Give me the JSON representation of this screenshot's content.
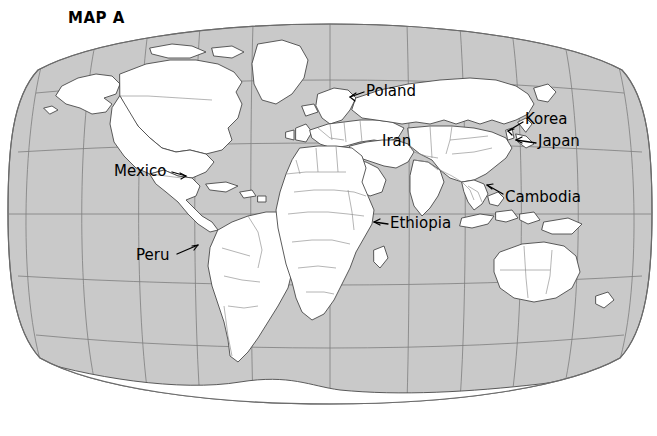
{
  "figure": {
    "title": "MAP A",
    "projection": "robinson",
    "type": "world-political-map",
    "ocean_color": "#c9c9c9",
    "land_color": "#ffffff",
    "coastline_color": "#4a4a4a",
    "border_color": "#8c8c8c",
    "graticule_color": "#7d7d7d",
    "label_color": "#000000",
    "background_color": "#ffffff"
  },
  "graticule": {
    "parallels": [
      60,
      30,
      0,
      -30,
      -60
    ],
    "meridians": [
      -150,
      -120,
      -90,
      -60,
      -30,
      0,
      30,
      60,
      90,
      120,
      150
    ],
    "visible": true
  },
  "labels": [
    {
      "id": "poland",
      "name": "Poland",
      "x": 366,
      "y": 84,
      "leader": true
    },
    {
      "id": "iran",
      "name": "Iran",
      "x": 382,
      "y": 134,
      "leader": false
    },
    {
      "id": "korea",
      "name": "Korea",
      "x": 525,
      "y": 112,
      "leader": true
    },
    {
      "id": "japan",
      "name": "Japan",
      "x": 538,
      "y": 134,
      "leader": true
    },
    {
      "id": "cambodia",
      "name": "Cambodia",
      "x": 505,
      "y": 190,
      "leader": true
    },
    {
      "id": "ethiopia",
      "name": "Ethiopia",
      "x": 390,
      "y": 216,
      "leader": true
    },
    {
      "id": "mexico",
      "name": "Mexico",
      "x": 114,
      "y": 164,
      "leader": true
    },
    {
      "id": "peru",
      "name": "Peru",
      "x": 136,
      "y": 248,
      "leader": true
    }
  ],
  "leader_lines": [
    {
      "id": "poland-leader",
      "from": [
        364,
        92
      ],
      "to": [
        350,
        97
      ]
    },
    {
      "id": "korea-leader",
      "from": [
        523,
        122
      ],
      "to": [
        508,
        131
      ]
    },
    {
      "id": "japan-leader",
      "from": [
        536,
        143
      ],
      "to": [
        516,
        140
      ]
    },
    {
      "id": "cambodia-leader",
      "from": [
        503,
        194
      ],
      "to": [
        487,
        185
      ]
    },
    {
      "id": "ethiopia-leader",
      "from": [
        388,
        224
      ],
      "to": [
        374,
        222
      ]
    },
    {
      "id": "mexico-leader",
      "from": [
        172,
        172
      ],
      "to": [
        186,
        176
      ]
    },
    {
      "id": "peru-leader",
      "from": [
        177,
        254
      ],
      "to": [
        198,
        245
      ]
    }
  ]
}
